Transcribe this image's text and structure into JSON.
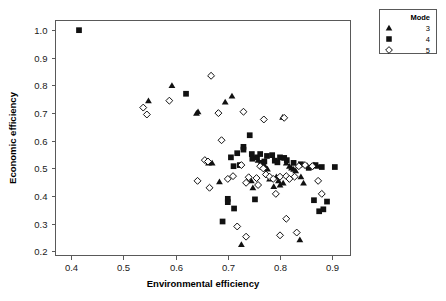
{
  "chart_data": {
    "type": "scatter",
    "title": "",
    "xlabel": "Environmental efficiency",
    "ylabel": "Economic efficiency",
    "xlim": [
      0.37,
      0.935
    ],
    "ylim": [
      0.185,
      1.035
    ],
    "xticks": [
      0.4,
      0.5,
      0.6,
      0.7,
      0.8,
      0.9
    ],
    "xticklabels": [
      "0.4",
      "0.5",
      "0.6",
      "0.7",
      "0.8",
      "0.9"
    ],
    "yticks": [
      0.2,
      0.3,
      0.4,
      0.5,
      0.6,
      0.7,
      0.8,
      0.9,
      1.0
    ],
    "yticklabels": [
      "0.2",
      "0.3",
      "0.4",
      "0.5",
      "0.6",
      "0.7",
      "0.8",
      "0.9",
      "1.0"
    ],
    "grid": false,
    "legend": {
      "title": "Mode",
      "position": "outside-top-right",
      "entries": [
        {
          "label": "3",
          "marker": "triangle",
          "style": "filled"
        },
        {
          "label": "4",
          "marker": "square",
          "style": "filled"
        },
        {
          "label": "5",
          "marker": "diamond",
          "style": "open"
        }
      ]
    },
    "series": [
      {
        "name": "3",
        "marker": "triangle",
        "style": "filled",
        "points": [
          [
            0.548,
            0.745
          ],
          [
            0.593,
            0.8
          ],
          [
            0.64,
            0.7
          ],
          [
            0.643,
            0.705
          ],
          [
            0.695,
            0.74
          ],
          [
            0.708,
            0.762
          ],
          [
            0.805,
            0.685
          ],
          [
            0.663,
            0.52
          ],
          [
            0.67,
            0.52
          ],
          [
            0.684,
            0.452
          ],
          [
            0.758,
            0.53
          ],
          [
            0.769,
            0.512
          ],
          [
            0.772,
            0.505
          ],
          [
            0.776,
            0.498
          ],
          [
            0.78,
            0.462
          ],
          [
            0.788,
            0.435
          ],
          [
            0.793,
            0.47
          ],
          [
            0.797,
            0.455
          ],
          [
            0.8,
            0.44
          ],
          [
            0.806,
            0.447
          ],
          [
            0.812,
            0.52
          ],
          [
            0.818,
            0.508
          ],
          [
            0.822,
            0.502
          ],
          [
            0.826,
            0.497
          ],
          [
            0.83,
            0.492
          ],
          [
            0.836,
            0.512
          ],
          [
            0.84,
            0.47
          ],
          [
            0.845,
            0.447
          ],
          [
            0.852,
            0.51
          ],
          [
            0.858,
            0.505
          ],
          [
            0.865,
            0.512
          ],
          [
            0.872,
            0.508
          ],
          [
            0.726,
            0.225
          ],
          [
            0.838,
            0.242
          ],
          [
            0.745,
            0.455
          ],
          [
            0.748,
            0.43
          ]
        ]
      },
      {
        "name": "4",
        "marker": "square",
        "style": "filled",
        "points": [
          [
            0.415,
            1.0
          ],
          [
            0.62,
            0.77
          ],
          [
            0.742,
            0.62
          ],
          [
            0.73,
            0.578
          ],
          [
            0.73,
            0.568
          ],
          [
            0.718,
            0.555
          ],
          [
            0.706,
            0.54
          ],
          [
            0.711,
            0.508
          ],
          [
            0.723,
            0.512
          ],
          [
            0.756,
            0.54
          ],
          [
            0.762,
            0.552
          ],
          [
            0.764,
            0.52
          ],
          [
            0.77,
            0.525
          ],
          [
            0.775,
            0.545
          ],
          [
            0.785,
            0.548
          ],
          [
            0.79,
            0.528
          ],
          [
            0.795,
            0.522
          ],
          [
            0.8,
            0.54
          ],
          [
            0.808,
            0.538
          ],
          [
            0.813,
            0.53
          ],
          [
            0.826,
            0.52
          ],
          [
            0.84,
            0.515
          ],
          [
            0.855,
            0.502
          ],
          [
            0.868,
            0.512
          ],
          [
            0.88,
            0.505
          ],
          [
            0.905,
            0.505
          ],
          [
            0.7,
            0.39
          ],
          [
            0.7,
            0.378
          ],
          [
            0.712,
            0.355
          ],
          [
            0.752,
            0.388
          ],
          [
            0.69,
            0.308
          ],
          [
            0.865,
            0.385
          ],
          [
            0.89,
            0.38
          ],
          [
            0.875,
            0.345
          ],
          [
            0.883,
            0.352
          ],
          [
            0.746,
            0.552
          ],
          [
            0.747,
            0.535
          ]
        ]
      },
      {
        "name": "5",
        "marker": "diamond",
        "style": "open",
        "points": [
          [
            0.538,
            0.72
          ],
          [
            0.545,
            0.695
          ],
          [
            0.588,
            0.745
          ],
          [
            0.668,
            0.835
          ],
          [
            0.682,
            0.7
          ],
          [
            0.73,
            0.705
          ],
          [
            0.769,
            0.677
          ],
          [
            0.808,
            0.683
          ],
          [
            0.656,
            0.53
          ],
          [
            0.662,
            0.525
          ],
          [
            0.688,
            0.602
          ],
          [
            0.7,
            0.462
          ],
          [
            0.71,
            0.472
          ],
          [
            0.726,
            0.512
          ],
          [
            0.735,
            0.448
          ],
          [
            0.74,
            0.468
          ],
          [
            0.755,
            0.465
          ],
          [
            0.762,
            0.508
          ],
          [
            0.768,
            0.5
          ],
          [
            0.773,
            0.478
          ],
          [
            0.78,
            0.47
          ],
          [
            0.787,
            0.462
          ],
          [
            0.8,
            0.47
          ],
          [
            0.812,
            0.472
          ],
          [
            0.818,
            0.462
          ],
          [
            0.828,
            0.47
          ],
          [
            0.836,
            0.508
          ],
          [
            0.848,
            0.512
          ],
          [
            0.862,
            0.508
          ],
          [
            0.873,
            0.455
          ],
          [
            0.88,
            0.408
          ],
          [
            0.792,
            0.408
          ],
          [
            0.642,
            0.455
          ],
          [
            0.665,
            0.43
          ],
          [
            0.718,
            0.29
          ],
          [
            0.812,
            0.318
          ],
          [
            0.8,
            0.258
          ],
          [
            0.832,
            0.268
          ],
          [
            0.735,
            0.253
          ],
          [
            0.758,
            0.44
          ]
        ]
      }
    ]
  }
}
